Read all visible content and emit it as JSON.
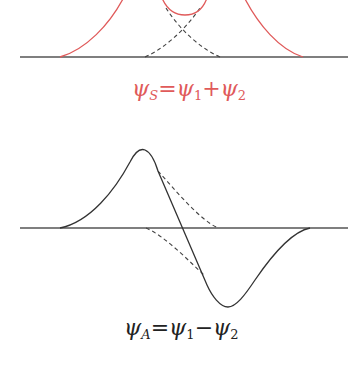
{
  "figure": {
    "colors": {
      "symmetric": "#e05a5a",
      "antisymmetric": "#333333",
      "axis": "#555555",
      "dashed": "#444444"
    },
    "symmetric": {
      "label": {
        "psi": "ψ",
        "sub_s": "S",
        "eq": "=",
        "psi1": "ψ",
        "sub_1": "1",
        "op": "+",
        "psi2": "ψ",
        "sub_2": "2"
      }
    },
    "antisymmetric": {
      "label": {
        "psi": "ψ",
        "sub_a": "A",
        "eq": "=",
        "psi1": "ψ",
        "sub_1": "1",
        "op": "−",
        "psi2": "ψ",
        "sub_2": "2"
      }
    }
  }
}
